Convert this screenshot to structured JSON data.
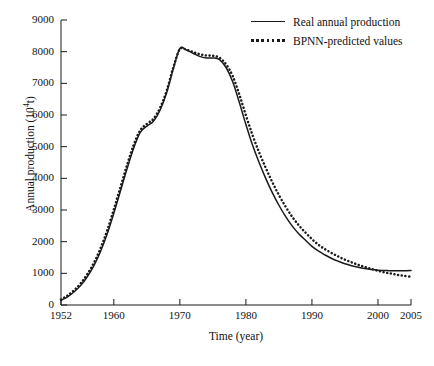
{
  "chart_data": {
    "type": "line",
    "title": "",
    "xlabel": "Time  (year)",
    "ylabel": "Annual production  (10^4 t)",
    "ylabel_prefix": "Annual production  (10",
    "ylabel_sup": "4",
    "ylabel_suffix": "t)",
    "xlim": [
      1952,
      2005
    ],
    "ylim": [
      0,
      9000
    ],
    "grid": false,
    "legend_position": "top-right",
    "xticks": [
      1952,
      1960,
      1970,
      1980,
      1990,
      2000,
      2005
    ],
    "xtick_labels": [
      "1952",
      "1960",
      "1970",
      "1980",
      "1990",
      "2000",
      "2005"
    ],
    "yticks": [
      0,
      1000,
      2000,
      3000,
      4000,
      5000,
      6000,
      7000,
      8000,
      9000
    ],
    "ytick_labels": [
      "0",
      "1000",
      "2000",
      "3000",
      "4000",
      "5000",
      "6000",
      "7000",
      "8000",
      "9000"
    ],
    "x": [
      1952,
      1953,
      1954,
      1955,
      1956,
      1957,
      1958,
      1959,
      1960,
      1961,
      1962,
      1963,
      1964,
      1965,
      1966,
      1967,
      1968,
      1969,
      1970,
      1971,
      1972,
      1973,
      1974,
      1975,
      1976,
      1977,
      1978,
      1979,
      1980,
      1981,
      1982,
      1983,
      1984,
      1985,
      1986,
      1987,
      1988,
      1989,
      1990,
      1991,
      1992,
      1993,
      1994,
      1995,
      1996,
      1997,
      1998,
      1999,
      2000,
      2001,
      2002,
      2003,
      2004,
      2005
    ],
    "series": [
      {
        "name": "Real annual production",
        "style": "solid",
        "color": "#1a1a1a",
        "values": [
          150,
          260,
          420,
          620,
          900,
          1250,
          1700,
          2250,
          2900,
          3600,
          4300,
          4950,
          5450,
          5650,
          5800,
          6150,
          6700,
          7450,
          8100,
          8050,
          7950,
          7850,
          7800,
          7800,
          7750,
          7500,
          7050,
          6400,
          5700,
          5050,
          4500,
          4000,
          3550,
          3150,
          2800,
          2500,
          2250,
          2050,
          1850,
          1700,
          1580,
          1470,
          1380,
          1300,
          1240,
          1190,
          1150,
          1120,
          1100,
          1090,
          1080,
          1080,
          1080,
          1090
        ]
      },
      {
        "name": "BPNN-predicted values",
        "style": "dotted",
        "color": "#1a1a1a",
        "values": [
          170,
          300,
          470,
          690,
          980,
          1340,
          1800,
          2360,
          3020,
          3720,
          4420,
          5050,
          5520,
          5720,
          5880,
          6230,
          6770,
          7500,
          8080,
          8060,
          7990,
          7920,
          7880,
          7870,
          7810,
          7600,
          7230,
          6650,
          5990,
          5370,
          4820,
          4330,
          3880,
          3470,
          3110,
          2790,
          2520,
          2290,
          2080,
          1900,
          1760,
          1640,
          1530,
          1430,
          1350,
          1270,
          1200,
          1140,
          1080,
          1030,
          990,
          950,
          920,
          890
        ]
      }
    ]
  },
  "legend": {
    "items": [
      {
        "label": "Real annual production",
        "style": "solid"
      },
      {
        "label": "BPNN-predicted values",
        "style": "dotted"
      }
    ]
  }
}
